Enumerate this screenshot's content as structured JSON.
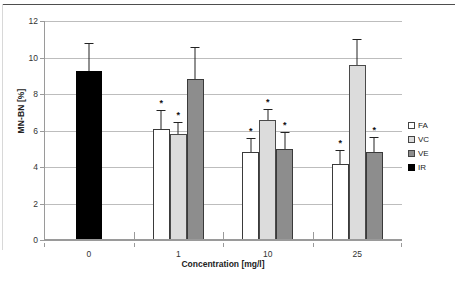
{
  "chart_data": {
    "type": "bar",
    "title": "",
    "xlabel": "Concentration [mg/l]",
    "ylabel": "MN-BN [%]",
    "categories": [
      "0",
      "1",
      "10",
      "25"
    ],
    "ylim": [
      0,
      12
    ],
    "yticks": [
      "0",
      "2",
      "4",
      "6",
      "8",
      "10",
      "12"
    ],
    "grid": true,
    "legend_position": "right",
    "series": [
      {
        "name": "FA",
        "color": "#ffffff",
        "values": [
          null,
          6.1,
          4.8,
          4.15
        ],
        "errors": [
          null,
          0.95,
          0.75,
          0.75
        ],
        "significance": [
          null,
          "*",
          "*",
          "*"
        ]
      },
      {
        "name": "VC",
        "color": "#dcdcdc",
        "values": [
          null,
          5.8,
          6.6,
          9.6
        ],
        "errors": [
          null,
          0.6,
          0.5,
          1.35
        ],
        "significance": [
          null,
          "*",
          "*",
          null
        ]
      },
      {
        "name": "VE",
        "color": "#8d8d8d",
        "values": [
          null,
          8.8,
          5.0,
          4.8
        ],
        "errors": [
          null,
          1.7,
          0.85,
          0.8
        ],
        "significance": [
          null,
          null,
          "*",
          "*"
        ]
      },
      {
        "name": "IR",
        "color": "#000000",
        "values": [
          9.25,
          null,
          null,
          null
        ],
        "errors": [
          1.5,
          null,
          null,
          null
        ],
        "significance": [
          null,
          null,
          null,
          null
        ]
      }
    ]
  },
  "legend": {
    "items": [
      {
        "label": "FA",
        "swatch": "fa"
      },
      {
        "label": "VC",
        "swatch": "vc"
      },
      {
        "label": "VE",
        "swatch": "ve"
      },
      {
        "label": "IR",
        "swatch": "ir"
      }
    ]
  },
  "axes": {
    "y_label": "MN-BN [%]",
    "x_label": "Concentration [mg/l]"
  }
}
